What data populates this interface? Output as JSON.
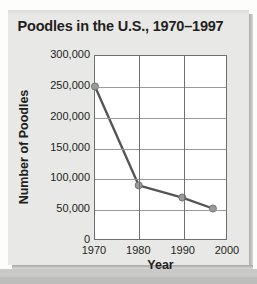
{
  "chart_data": {
    "type": "line",
    "title": "Poodles in the U.S., 1970–1997",
    "xlabel": "Year",
    "ylabel": "Number of Poodles",
    "x": [
      1970,
      1980,
      1990,
      1997
    ],
    "values": [
      250000,
      88000,
      68000,
      50000
    ],
    "series": [
      {
        "name": "Number of Poodles",
        "values": [
          250000,
          88000,
          68000,
          50000
        ]
      }
    ],
    "point_labels": [
      "250,000",
      "88,000",
      "68,000",
      "50,000"
    ],
    "xlim": [
      1970,
      2000
    ],
    "ylim": [
      0,
      300000
    ],
    "xticks": [
      1970,
      1980,
      1990,
      2000
    ],
    "xtick_labels": [
      "1970",
      "1980",
      "1990",
      "2000"
    ],
    "yticks": [
      0,
      50000,
      100000,
      150000,
      200000,
      250000,
      300000
    ],
    "ytick_labels": [
      "300,000",
      "250,000",
      "200,000",
      "150,000",
      "100,000",
      "50,000",
      "0"
    ],
    "grid": true,
    "legend": false,
    "line_color": "#555555",
    "marker_color": "#9a9a9a",
    "marker_edge_color": "#6b6b6b",
    "plot_background": "#ffffff",
    "panel_background": "#e8e8e6",
    "text_color": "#231f20"
  }
}
